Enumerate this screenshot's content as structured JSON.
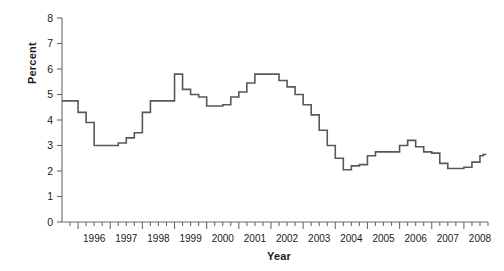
{
  "chart_data": {
    "type": "line",
    "title": "",
    "subtitle": "",
    "xlabel": "Year",
    "ylabel": "Percent",
    "ylim": [
      0,
      8
    ],
    "yticks": [
      0,
      1,
      2,
      3,
      4,
      5,
      6,
      7,
      8
    ],
    "ytick_labels": [
      "0",
      "1",
      "2",
      "3",
      "4",
      "5",
      "6",
      "7",
      "8"
    ],
    "xlim": [
      1995.5,
      2008.75
    ],
    "xtick_labels": [
      "1996",
      "1997",
      "1998",
      "1999",
      "2000",
      "2001",
      "2002",
      "2003",
      "2004",
      "2005",
      "2006",
      "2007",
      "2008"
    ],
    "minor_tick_interval": 0.25,
    "grid": false,
    "legend": null,
    "line_style": "step",
    "line_color": "#58585a",
    "line_width": 1.6,
    "x": [
      1995.5,
      1995.75,
      1996.0,
      1996.25,
      1996.5,
      1996.75,
      1997.0,
      1997.25,
      1997.5,
      1997.75,
      1998.0,
      1998.25,
      1998.5,
      1998.75,
      1999.0,
      1999.25,
      1999.5,
      1999.75,
      2000.0,
      2000.25,
      2000.5,
      2000.75,
      2001.0,
      2001.25,
      2001.5,
      2001.75,
      2002.0,
      2002.25,
      2002.5,
      2002.75,
      2003.0,
      2003.25,
      2003.5,
      2003.75,
      2004.0,
      2004.25,
      2004.5,
      2004.75,
      2005.0,
      2005.25,
      2005.5,
      2005.75,
      2006.0,
      2006.25,
      2006.5,
      2006.75,
      2007.0,
      2007.25,
      2007.5,
      2007.75,
      2008.0,
      2008.25,
      2008.5,
      2008.6
    ],
    "values": [
      4.75,
      4.75,
      4.3,
      3.9,
      3.0,
      3.0,
      3.0,
      3.1,
      3.3,
      3.5,
      4.3,
      4.75,
      4.75,
      4.75,
      5.8,
      5.2,
      5.0,
      4.9,
      4.55,
      4.55,
      4.6,
      4.9,
      5.1,
      5.45,
      5.8,
      5.8,
      5.8,
      5.55,
      5.3,
      5.0,
      4.6,
      4.2,
      3.6,
      3.0,
      2.5,
      2.05,
      2.2,
      2.25,
      2.6,
      2.75,
      2.75,
      2.75,
      3.0,
      3.2,
      2.95,
      2.75,
      2.7,
      2.3,
      2.1,
      2.1,
      2.15,
      2.35,
      2.6,
      2.65
    ],
    "series_note": "quarterly step series",
    "annotations": []
  },
  "axis": {
    "y_title": "Percent",
    "x_title": "Year"
  }
}
